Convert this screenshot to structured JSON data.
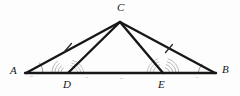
{
  "figure": {
    "kind": "geometry-diagram",
    "width": 240,
    "height": 96,
    "background_color": "#fdfdfd",
    "stroke_color": "#17171a",
    "mark_color": "#a9a9ae",
    "points": [
      {
        "id": "A",
        "label": "A",
        "x": 26,
        "y": 73,
        "label_x": 10,
        "label_y": 66
      },
      {
        "id": "B",
        "label": "B",
        "x": 215,
        "y": 73,
        "label_x": 222,
        "label_y": 65
      },
      {
        "id": "C",
        "label": "C",
        "x": 120,
        "y": 22,
        "label_x": 117,
        "label_y": 2
      },
      {
        "id": "D",
        "label": "D",
        "x": 68,
        "y": 73,
        "label_x": 63,
        "label_y": 80
      },
      {
        "id": "E",
        "label": "E",
        "x": 163,
        "y": 73,
        "label_x": 158,
        "label_y": 80
      }
    ],
    "segments": [
      {
        "id": "AB",
        "from": "A",
        "to": "B",
        "x1": 26,
        "y1": 73,
        "x2": 215,
        "y2": 73,
        "width": 2.4
      },
      {
        "id": "AC",
        "from": "A",
        "to": "C",
        "x1": 26,
        "y1": 73,
        "x2": 120,
        "y2": 22,
        "width": 2.4
      },
      {
        "id": "CB",
        "from": "C",
        "to": "B",
        "x1": 120,
        "y1": 22,
        "x2": 215,
        "y2": 73,
        "width": 2.4
      },
      {
        "id": "CD",
        "from": "C",
        "to": "D",
        "x1": 120,
        "y1": 22,
        "x2": 68,
        "y2": 73,
        "width": 2.4
      },
      {
        "id": "CE",
        "from": "C",
        "to": "E",
        "x1": 120,
        "y1": 22,
        "x2": 163,
        "y2": 73,
        "width": 2.4
      }
    ],
    "tick_marks": [
      {
        "id": "tick-AC",
        "on_segment": "AC",
        "count": 1,
        "x": 68,
        "y": 47
      },
      {
        "id": "tick-CB",
        "on_segment": "CB",
        "count": 1,
        "x": 169,
        "y": 48
      }
    ],
    "angle_arcs": [
      {
        "id": "angle-A",
        "at": "A",
        "count": 1,
        "opens": "right"
      },
      {
        "id": "angle-B",
        "at": "B",
        "count": 1,
        "opens": "left"
      },
      {
        "id": "angle-ADC",
        "at": "D",
        "count": 3,
        "opens": "left"
      },
      {
        "id": "angle-CEB",
        "at": "E",
        "count": 3,
        "opens": "right"
      },
      {
        "id": "angle-CDE",
        "at": "D",
        "count": 3,
        "opens": "right"
      },
      {
        "id": "angle-AEC",
        "at": "E",
        "count": 3,
        "opens": "left"
      }
    ]
  }
}
